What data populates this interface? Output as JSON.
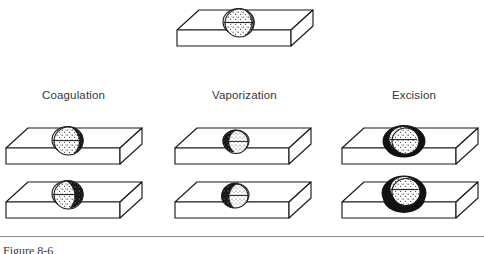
{
  "figure": {
    "caption": "Figure 8-6",
    "background_color": "#ffffff",
    "ink_color": "#1a1a1a",
    "label_color": "#35353a",
    "rule_color": "#8b8b8b"
  },
  "reference": {
    "name": "untreated-lesion",
    "description": "Tissue block with intact spherical lesion"
  },
  "columns": [
    {
      "id": "coagulation",
      "label": "Coagulation",
      "label_x": 42,
      "label_y": 96,
      "stages": [
        {
          "id": "coagulation-stage-1",
          "description": "Lesion with coagulated dark rim at upper right"
        },
        {
          "id": "coagulation-stage-2",
          "description": "Lesion with enlarged coagulated dark zone"
        }
      ]
    },
    {
      "id": "vaporization",
      "label": "Vaporization",
      "label_x": 212,
      "label_y": 96,
      "stages": [
        {
          "id": "vaporization-stage-1",
          "description": "Lesion partly vaporized, dark crater at upper left"
        },
        {
          "id": "vaporization-stage-2",
          "description": "Lesion largely vaporized, crater enlarged"
        }
      ]
    },
    {
      "id": "excision",
      "label": "Excision",
      "label_x": 392,
      "label_y": 96,
      "stages": [
        {
          "id": "excision-stage-1",
          "description": "Lesion encircled by dark incision margin"
        },
        {
          "id": "excision-stage-2",
          "description": "Lesion fully encircled and undercut by incision"
        }
      ]
    }
  ]
}
